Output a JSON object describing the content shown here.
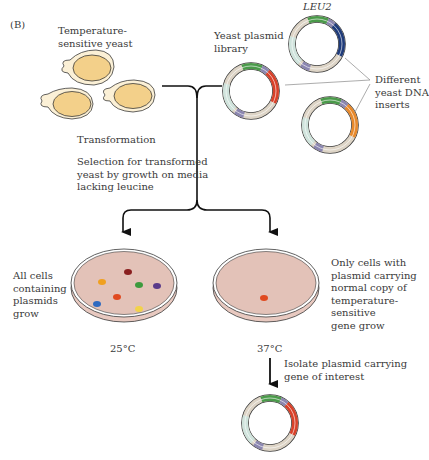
{
  "panel_label": "(B)",
  "labels": {
    "ts_yeast": "Temperature-\nsensitive yeast",
    "plasmid_library": "Yeast plasmid\nlibrary",
    "leu2": "LEU2",
    "different_inserts": "Different\nyeast DNA\ninserts",
    "transformation": "Transformation",
    "selection": "Selection for transformed\nyeast by growth on media\nlacking leucine",
    "all_cells": "All cells\ncontaining\nplasmids\ngrow",
    "only_cells": "Only cells with\nplasmid carrying\nnormal copy of\ntemperature-sensitive\ngene grow",
    "temp_left": "25°C",
    "temp_right": "37°C",
    "isolate": "Isolate plasmid carrying\ngene of interest"
  },
  "colors": {
    "yeast_fill": "#f3d08a",
    "yeast_outer": "#fbf0d6",
    "plasmid_backbone": "#ddd4c6",
    "plasmid_light": "#cfe3dc",
    "leu2_segment": "#4a9a4a",
    "marker_purple": "#8b86b0",
    "insert_red": "#d8412a",
    "insert_navy": "#1f3b7a",
    "insert_orange": "#e7892c",
    "agar": "#e3c2b8",
    "colony_colors": [
      "#8a1f1f",
      "#f0a020",
      "#3d9a3d",
      "#5a3a8a",
      "#e04a20",
      "#2f6ac0",
      "#f2d24a"
    ]
  }
}
